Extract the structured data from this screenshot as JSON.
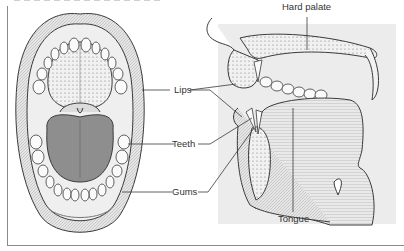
{
  "figure": {
    "type": "anatomy-diagram",
    "views": [
      "front-view-open-mouth",
      "sagittal-section-mouth"
    ],
    "labels": {
      "hard_palate": "Hard palate",
      "lips": "Lips",
      "teeth": "Teeth",
      "gums": "Gums",
      "tongue": "Tongue"
    },
    "colors": {
      "line": "#3a3a3a",
      "tongue_fill": "#8e8e8e",
      "stipple": "#c8c8c8",
      "shade": "#e4e4e4",
      "frame": "#8a8a8a"
    }
  }
}
